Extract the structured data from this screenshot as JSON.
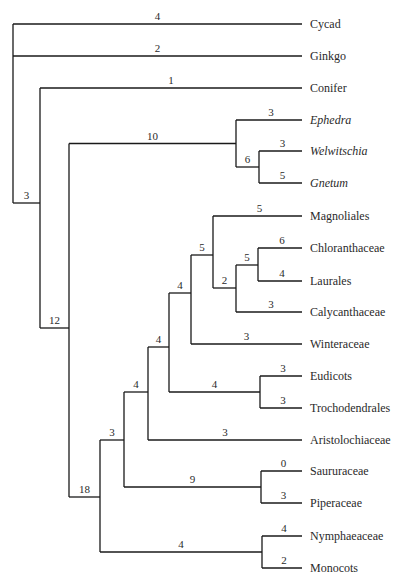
{
  "diagram": {
    "type": "phylogenetic-tree",
    "tree": {
      "id": "root",
      "children": [
        {
          "id": "cycad",
          "taxon": "Cycad",
          "branch_length": "4"
        },
        {
          "id": "ginkgo",
          "taxon": "Ginkgo",
          "branch_length": "2"
        },
        {
          "id": "conifer-angio-gnet",
          "branch_length": "3",
          "children": [
            {
              "id": "conifer",
              "taxon": "Conifer",
              "branch_length": "1"
            },
            {
              "id": "gnet-angio",
              "branch_length": "12",
              "children": [
                {
                  "id": "gnetales",
                  "branch_length": "10",
                  "children": [
                    {
                      "id": "ephedra",
                      "taxon": "Ephedra",
                      "italic": true,
                      "branch_length": "3"
                    },
                    {
                      "id": "welw-gnetum",
                      "branch_length": "6",
                      "children": [
                        {
                          "id": "welwitschia",
                          "taxon": "Welwitschia",
                          "italic": true,
                          "branch_length": "3"
                        },
                        {
                          "id": "gnetum",
                          "taxon": "Gnetum",
                          "italic": true,
                          "branch_length": "5"
                        }
                      ]
                    }
                  ]
                },
                {
                  "id": "angiosperms",
                  "branch_length": "18",
                  "children": [
                    {
                      "id": "ang-a",
                      "branch_length": "3",
                      "children": [
                        {
                          "id": "ang-b",
                          "branch_length": "4",
                          "children": [
                            {
                              "id": "ang-c",
                              "branch_length": "4",
                              "children": [
                                {
                                  "id": "magnoliids",
                                  "branch_length": "4",
                                  "children": [
                                    {
                                      "id": "mag-a",
                                      "branch_length": "5",
                                      "children": [
                                        {
                                          "id": "magnoliales",
                                          "taxon": "Magnoliales",
                                          "branch_length": "5"
                                        },
                                        {
                                          "id": "laurales-grp",
                                          "branch_length": "2",
                                          "children": [
                                            {
                                              "id": "chlor-laur",
                                              "branch_length": "5",
                                              "children": [
                                                {
                                                  "id": "chloranthaceae",
                                                  "taxon": "Chloranthaceae",
                                                  "branch_length": "6"
                                                },
                                                {
                                                  "id": "laurales",
                                                  "taxon": "Laurales",
                                                  "branch_length": "4"
                                                }
                                              ]
                                            },
                                            {
                                              "id": "calycanthaceae",
                                              "taxon": "Calycanthaceae",
                                              "branch_length": "3"
                                            }
                                          ]
                                        }
                                      ]
                                    },
                                    {
                                      "id": "winteraceae",
                                      "taxon": "Winteraceae",
                                      "branch_length": "3"
                                    }
                                  ]
                                },
                                {
                                  "id": "eud-troch",
                                  "branch_length": "4",
                                  "children": [
                                    {
                                      "id": "eudicots",
                                      "taxon": "Eudicots",
                                      "branch_length": "3"
                                    },
                                    {
                                      "id": "trochodendrales",
                                      "taxon": "Trochodendrales",
                                      "branch_length": "3"
                                    }
                                  ]
                                }
                              ]
                            },
                            {
                              "id": "aristolochiaceae",
                              "taxon": "Aristolochiaceae",
                              "branch_length": "3"
                            }
                          ]
                        },
                        {
                          "id": "piperales",
                          "branch_length": "9",
                          "children": [
                            {
                              "id": "saururaceae",
                              "taxon": "Saururaceae",
                              "branch_length": "0"
                            },
                            {
                              "id": "piperaceae",
                              "taxon": "Piperaceae",
                              "branch_length": "3"
                            }
                          ]
                        }
                      ]
                    },
                    {
                      "id": "nymph-mono",
                      "branch_length": "4",
                      "children": [
                        {
                          "id": "nymphaeaceae",
                          "taxon": "Nymphaeaceae",
                          "branch_length": "4"
                        },
                        {
                          "id": "monocots",
                          "taxon": "Monocots",
                          "branch_length": "2"
                        }
                      ]
                    }
                  ]
                }
              ]
            }
          ]
        }
      ]
    }
  }
}
